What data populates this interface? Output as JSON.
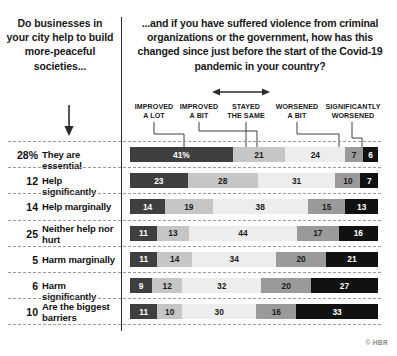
{
  "questions": {
    "left": "Do businesses in your city help to build more-peaceful societies...",
    "right": "...and if you have suffered violence from criminal organizations or the government, how has this changed since just before the start of the Covid-19 pandemic in your country?"
  },
  "icons": {
    "down_arrow": "down-arrow-icon",
    "span_arrow": "left-right-arrow-icon"
  },
  "credit": "© HBR",
  "chart_data": {
    "type": "bar",
    "subtype": "stacked-horizontal-100",
    "title": "...and if you have suffered violence from criminal organizations or the government, how has this changed since just before the start of the Covid-19 pandemic in your country?",
    "row_group_title": "Do businesses in your city help to build more-peaceful societies...",
    "xlabel": "",
    "ylabel": "",
    "xlim": [
      0,
      100
    ],
    "grid": false,
    "legend_position": "top",
    "series": [
      {
        "name": "IMPROVED A LOT",
        "color": "#3f3f3f",
        "values": [
          41,
          23,
          14,
          11,
          11,
          9,
          11
        ]
      },
      {
        "name": "IMPROVED A BIT",
        "color": "#c6c6c6",
        "values": [
          21,
          28,
          19,
          13,
          14,
          12,
          10
        ]
      },
      {
        "name": "STAYED THE SAME",
        "color": "#ededed",
        "values": [
          24,
          31,
          38,
          44,
          34,
          32,
          30
        ]
      },
      {
        "name": "WORSENED A BIT",
        "color": "#9a9a9a",
        "values": [
          7,
          10,
          15,
          17,
          20,
          20,
          16
        ]
      },
      {
        "name": "SIGNIFICANTLY WORSENED",
        "color": "#111111",
        "values": [
          6,
          7,
          13,
          16,
          21,
          27,
          33
        ]
      }
    ],
    "categories": [
      "They are essential",
      "Help significantly",
      "Help marginally",
      "Neither help nor hurt",
      "Harm marginally",
      "Harm significantly",
      "Are the biggest barriers"
    ],
    "category_shares": [
      "28%",
      "12",
      "14",
      "25",
      "5",
      "6",
      "10"
    ],
    "value_labels": [
      [
        "41%",
        "21",
        "24",
        "7",
        "6"
      ],
      [
        "23",
        "28",
        "31",
        "10",
        "7"
      ],
      [
        "14",
        "19",
        "38",
        "15",
        "13"
      ],
      [
        "11",
        "13",
        "44",
        "17",
        "16"
      ],
      [
        "11",
        "14",
        "34",
        "20",
        "21"
      ],
      [
        "9",
        "12",
        "32",
        "20",
        "27"
      ],
      [
        "11",
        "10",
        "30",
        "16",
        "33"
      ]
    ]
  },
  "headers": [
    {
      "line1": "IMPROVED",
      "line2": "A LOT"
    },
    {
      "line1": "IMPROVED",
      "line2": "A BIT"
    },
    {
      "line1": "STAYED",
      "line2": "THE SAME"
    },
    {
      "line1": "WORSENED",
      "line2": "A BIT"
    },
    {
      "line1": "SIGNIFICANTLY",
      "line2": "WORSENED"
    }
  ],
  "rows": [
    {
      "share": "28%",
      "label": "They are essential",
      "labels": [
        "41%",
        "21",
        "24",
        "7",
        "6"
      ]
    },
    {
      "share": "12",
      "label": "Help significantly",
      "labels": [
        "23",
        "28",
        "31",
        "10",
        "7"
      ]
    },
    {
      "share": "14",
      "label": "Help marginally",
      "labels": [
        "14",
        "19",
        "38",
        "15",
        "13"
      ]
    },
    {
      "share": "25",
      "label": "Neither help nor hurt",
      "labels": [
        "11",
        "13",
        "44",
        "17",
        "16"
      ]
    },
    {
      "share": "5",
      "label": "Harm marginally",
      "labels": [
        "11",
        "14",
        "34",
        "20",
        "21"
      ]
    },
    {
      "share": "6",
      "label": "Harm significantly",
      "labels": [
        "9",
        "12",
        "32",
        "20",
        "27"
      ]
    },
    {
      "share": "10",
      "label": "Are the biggest barriers",
      "labels": [
        "11",
        "10",
        "30",
        "16",
        "33"
      ]
    }
  ]
}
